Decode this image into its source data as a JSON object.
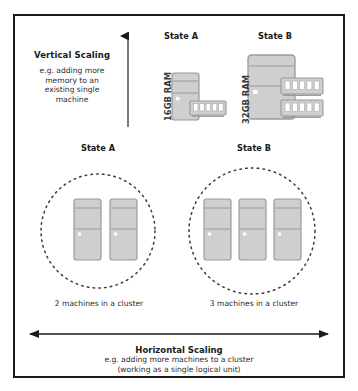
{
  "diagram": {
    "frame_border_color": "#1b1b1b",
    "background_color": "#ffffff"
  },
  "vertical_section": {
    "title": "Vertical Scaling",
    "description": "e.g. adding more\nmemory to an\nexisting single\nmachine",
    "axis_arrow": "up-arrow",
    "states": [
      {
        "label": "State A",
        "ram_label": "16GB RAM",
        "ram_gb": 16,
        "ram_sticks": 1,
        "tower_size": "small"
      },
      {
        "label": "State B",
        "ram_label": "32GB RAM",
        "ram_gb": 32,
        "ram_sticks": 2,
        "tower_size": "large"
      }
    ]
  },
  "horizontal_section": {
    "title": "Horizontal Scaling",
    "description_line1": "e.g. adding more machines to a cluster",
    "description_line2": "(working as a single logical unit)",
    "axis_arrow": "double-headed-horizontal-arrow",
    "states": [
      {
        "label": "State A",
        "caption": "2 machines in a cluster",
        "machine_count": 2
      },
      {
        "label": "State B",
        "caption": "3 machines in a cluster",
        "machine_count": 3
      }
    ]
  },
  "colors": {
    "machine_fill": "#cfcfcf",
    "machine_stroke": "#9a9a9a",
    "ram_fill": "#cfcfcf",
    "ram_chip": "#ffffff",
    "cluster_circle": "#3a3a3a",
    "arrow": "#1a1a1a",
    "text": "#2b2b2b"
  }
}
